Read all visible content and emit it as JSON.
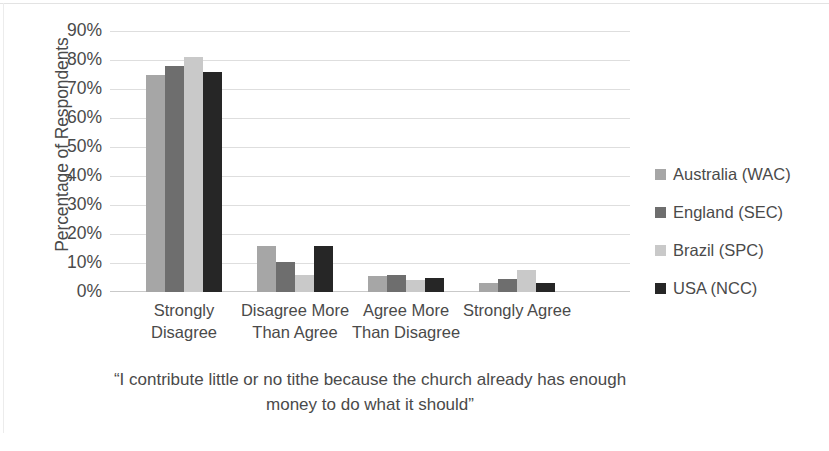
{
  "chart_data": {
    "type": "bar",
    "title": "",
    "caption": "“I contribute little or no tithe because the church already has enough money to do what it should”",
    "caption_line1": "“I contribute little or no tithe because the church already has enough",
    "caption_line2": "money to do what it should”",
    "xlabel": "",
    "ylabel": "Percentage of Respondents",
    "ylim": [
      0,
      90
    ],
    "ytick_labels": [
      "90%",
      "80%",
      "70%",
      "60%",
      "50%",
      "40%",
      "30%",
      "20%",
      "10%",
      "0%"
    ],
    "ytick_values": [
      90,
      80,
      70,
      60,
      50,
      40,
      30,
      20,
      10,
      0
    ],
    "grid": true,
    "legend_position": "right",
    "categories": [
      "Strongly Disagree",
      "Disagree More Than Agree",
      "Agree More Than Disagree",
      "Strongly Agree"
    ],
    "category_lines": [
      [
        "Strongly",
        "Disagree"
      ],
      [
        "Disagree More",
        "Than Agree"
      ],
      [
        "Agree More",
        "Than Disagree"
      ],
      [
        "Strongly Agree",
        ""
      ]
    ],
    "series": [
      {
        "name": "Australia (WAC)",
        "color": "#a6a6a6",
        "values": [
          75,
          16,
          5.5,
          3
        ]
      },
      {
        "name": "England (SEC)",
        "color": "#6e6e6e",
        "values": [
          78,
          10.5,
          6,
          4.5
        ]
      },
      {
        "name": "Brazil (SPC)",
        "color": "#c9c9c9",
        "values": [
          81,
          6,
          4,
          7.5
        ]
      },
      {
        "name": "USA (NCC)",
        "color": "#262626",
        "values": [
          76,
          16,
          5,
          3
        ]
      }
    ]
  },
  "legend": {
    "items": [
      {
        "label": "Australia (WAC)",
        "color": "#a6a6a6"
      },
      {
        "label": "England (SEC)",
        "color": "#6e6e6e"
      },
      {
        "label": "Brazil (SPC)",
        "color": "#c9c9c9"
      },
      {
        "label": "USA (NCC)",
        "color": "#262626"
      }
    ]
  },
  "colors": {
    "grid": "#dedede",
    "text": "#4a4a4a",
    "background": "#ffffff"
  }
}
